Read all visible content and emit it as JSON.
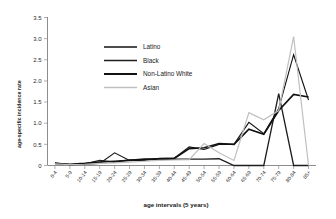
{
  "chart_data": {
    "type": "line",
    "title": "",
    "xlabel": "age intervals (5 years)",
    "ylabel": "age-specific incidence rate",
    "ylim": [
      0,
      3.5
    ],
    "ytick_labels": [
      "3.5",
      "3.0",
      "2.5",
      "2.0",
      "1.5",
      "1.0",
      "0.5",
      "0"
    ],
    "ytick_values": [
      3.5,
      3.0,
      2.5,
      2.0,
      1.5,
      1.0,
      0.5,
      0
    ],
    "grid": false,
    "legend_position": "upper-left-inside",
    "categories": [
      "0-4",
      "5-9",
      "10-14",
      "15-19",
      "20-24",
      "25-29",
      "30-34",
      "35-39",
      "40-44",
      "45-49",
      "50-54",
      "55-59",
      "60-64",
      "65-69",
      "70-74",
      "75-79",
      "80-84",
      "85+"
    ],
    "series": [
      {
        "name": "Latino",
        "color": "#111111",
        "width": 1.1,
        "values": [
          0.06,
          0.02,
          0.03,
          0.05,
          0.3,
          0.12,
          0.12,
          0.17,
          0.17,
          0.44,
          0.38,
          0.5,
          0.5,
          1.02,
          0.75,
          1.35,
          2.62,
          1.55
        ]
      },
      {
        "name": "Black",
        "color": "#1d1d1d",
        "width": 1.3,
        "values": [
          0.05,
          0.02,
          0.04,
          0.12,
          0.08,
          0.13,
          0.14,
          0.14,
          0.15,
          0.15,
          0.15,
          0.16,
          0.0,
          0.0,
          0.0,
          1.7,
          0.0,
          0.0
        ]
      },
      {
        "name": "Non-Latino White",
        "color": "#111111",
        "width": 1.7,
        "values": [
          0.05,
          0.03,
          0.05,
          0.08,
          0.1,
          0.12,
          0.15,
          0.16,
          0.17,
          0.4,
          0.42,
          0.52,
          0.5,
          0.86,
          0.74,
          1.3,
          1.68,
          1.62
        ]
      },
      {
        "name": "Asian",
        "color": "#bfbfbf",
        "width": 1.2,
        "values": [
          0.04,
          0.02,
          0.03,
          0.05,
          0.06,
          0.08,
          0.1,
          0.12,
          0.13,
          0.14,
          0.52,
          0.3,
          0.12,
          1.25,
          1.08,
          1.3,
          3.05,
          0.0
        ]
      }
    ]
  },
  "legend": {
    "items": [
      {
        "label": "Latino"
      },
      {
        "label": "Black"
      },
      {
        "label": "Non-Latino White"
      },
      {
        "label": "Asian"
      }
    ]
  }
}
